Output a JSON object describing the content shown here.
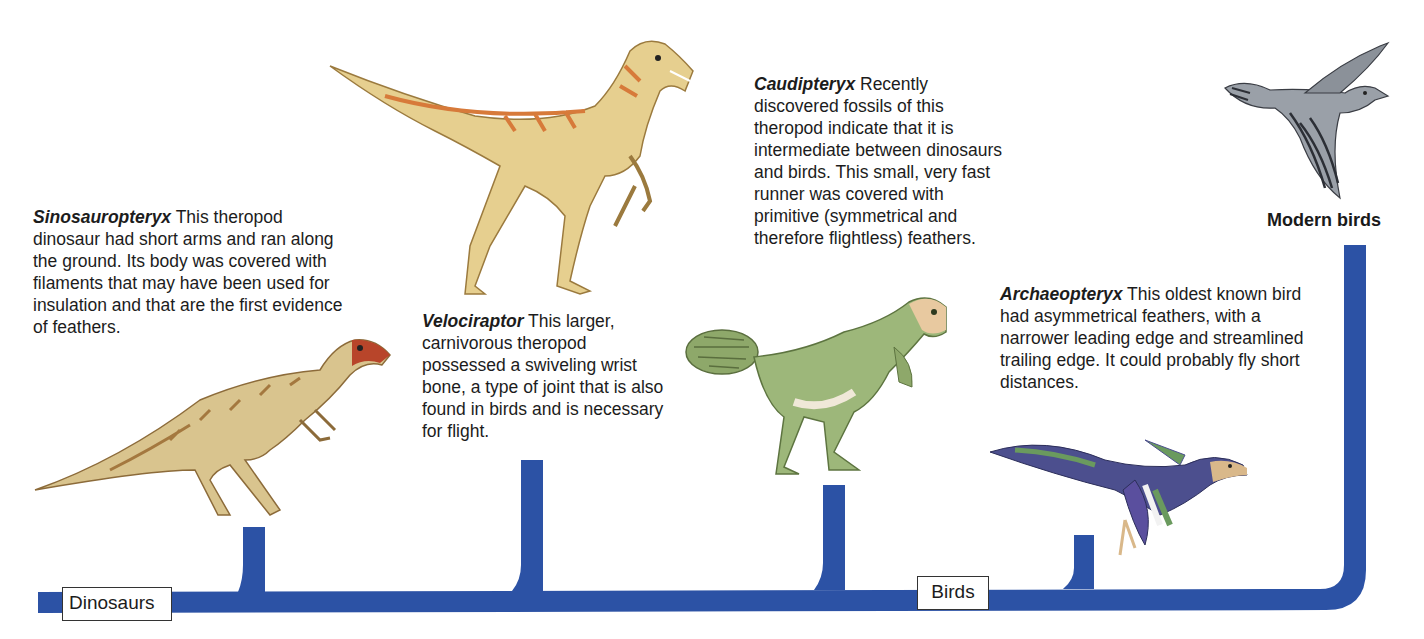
{
  "diagram": {
    "type": "phylogenetic-tree",
    "trunk_color": "#2c52a5",
    "root_label": "Dinosaurs",
    "bird_label": "Birds",
    "terminal_label": "Modern birds",
    "taxa": [
      {
        "name": "Sinosauropteryx",
        "text": " This theropod dinosaur had short arms and ran along the ground. Its body was covered with filaments that may have been used for insulation and that are the first evidence of feathers.",
        "illustration": "sinosauropteryx-illustration",
        "colors": [
          "#d9c48e",
          "#a4783f",
          "#b8452a"
        ]
      },
      {
        "name": "Velociraptor",
        "text": " This larger, carnivorous theropod possessed a swiveling wrist bone, a type of joint that is also found in birds and is necessary for flight.",
        "illustration": "velociraptor-illustration",
        "colors": [
          "#e6cf8f",
          "#d77a3a"
        ]
      },
      {
        "name": "Caudipteryx",
        "text": " Recently discovered fossils of this theropod indicate that it is intermediate between dinosaurs and birds. This small, very fast runner was covered with primitive (symmetrical and therefore flightless) feathers.",
        "illustration": "caudipteryx-illustration",
        "colors": [
          "#9db77a",
          "#f0e8d8",
          "#e8c9a0"
        ]
      },
      {
        "name": "Archaeopteryx",
        "text": " This oldest known bird had asymmetrical feathers, with a narrower leading edge and streamlined trailing edge. It could probably fly short distances.",
        "illustration": "archaeopteryx-illustration",
        "colors": [
          "#4c4f8e",
          "#6a9a5e",
          "#6e5a4c",
          "#d9b88a"
        ]
      }
    ],
    "modern": {
      "illustration": "modern-bird-illustration",
      "colors": [
        "#9aa0a8",
        "#2c2f36"
      ]
    }
  }
}
